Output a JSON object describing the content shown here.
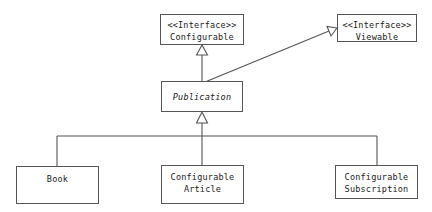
{
  "diagram": {
    "type": "uml-class-diagram",
    "background_color": "#ffffff",
    "stroke_color": "#555555",
    "text_color": "#1a1a1a",
    "interface_stereotype": "<<Interface>>",
    "nodes": {
      "configurable": {
        "stereotype": "<<Interface>>",
        "name": "Configurable",
        "kind": "interface"
      },
      "viewable": {
        "stereotype": "<<Interface>>",
        "name": "Viewable",
        "kind": "interface"
      },
      "publication": {
        "name": "Publication",
        "kind": "abstract-class"
      },
      "book": {
        "name": "Book",
        "kind": "class"
      },
      "article": {
        "name_line1": "Configurable",
        "name_line2": "Article",
        "kind": "class"
      },
      "subscription": {
        "name_line1": "Configurable",
        "name_line2": "Subscription",
        "kind": "class"
      }
    },
    "relationships": [
      {
        "from": "publication",
        "to": "configurable",
        "kind": "realization",
        "arrow": "hollow-triangle"
      },
      {
        "from": "publication",
        "to": "viewable",
        "kind": "realization",
        "arrow": "hollow-triangle"
      },
      {
        "from": "book",
        "to": "publication",
        "kind": "generalization",
        "arrow": "hollow-triangle"
      },
      {
        "from": "article",
        "to": "publication",
        "kind": "generalization",
        "arrow": "hollow-triangle"
      },
      {
        "from": "subscription",
        "to": "publication",
        "kind": "generalization",
        "arrow": "hollow-triangle"
      }
    ]
  }
}
